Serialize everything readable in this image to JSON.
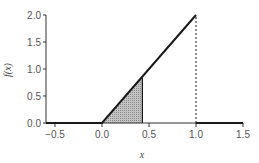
{
  "chart_data": {
    "type": "line",
    "title": "",
    "xlabel": "x",
    "ylabel": "f(x)",
    "xlim": [
      -0.6,
      1.5
    ],
    "ylim": [
      0.0,
      2.0
    ],
    "x_ticks": [
      -0.5,
      0.0,
      0.5,
      1.0,
      1.5
    ],
    "x_tick_labels": [
      "−0.5",
      "0.0",
      "0.5",
      "1.0",
      "1.5"
    ],
    "y_ticks": [
      0.0,
      0.5,
      1.0,
      1.5,
      2.0
    ],
    "y_tick_labels": [
      "0.0",
      "0.5",
      "1.0",
      "1.5",
      "2.0"
    ],
    "grid": false,
    "legend": null,
    "series": [
      {
        "name": "f(x)",
        "style": "solid",
        "points": [
          [
            -0.6,
            0.0
          ],
          [
            0.0,
            0.0
          ],
          [
            1.0,
            2.0
          ]
        ]
      },
      {
        "name": "f(x) right segment",
        "style": "solid",
        "points": [
          [
            1.0,
            0.0
          ],
          [
            1.5,
            0.0
          ]
        ]
      },
      {
        "name": "discontinuity at x=1",
        "style": "dashed",
        "points": [
          [
            1.0,
            0.0
          ],
          [
            1.0,
            2.0
          ]
        ]
      }
    ],
    "shaded_region": {
      "x_from": 0.0,
      "x_to": 0.43,
      "under": "f(x)",
      "fill": "#b0b0b0"
    },
    "colors": {
      "line": "#1a1a1a",
      "axis": "#333333",
      "shade": "#b0b0b0",
      "text": "#555555"
    }
  }
}
